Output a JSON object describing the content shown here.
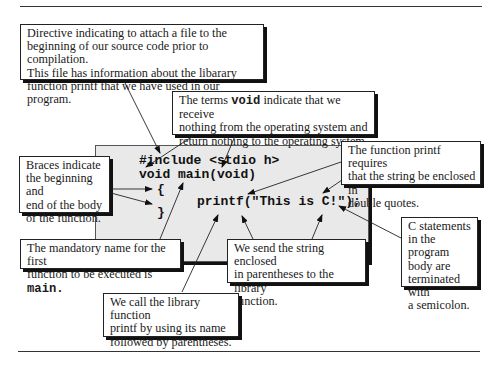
{
  "code": {
    "line1": "#include <stdio h>",
    "line2": "void main(void)",
    "brace_open": "{",
    "statement": "printf(\"This is C!\");",
    "brace_close": "}"
  },
  "callouts": {
    "include": {
      "lines": [
        "Directive indicating to attach a file to the",
        "beginning of our source code prior to compilation.",
        "This file has information about the libarary",
        "function printf that we have used in our program."
      ]
    },
    "void": {
      "pre": "The terms ",
      "keyword": "void",
      "post": " indicate that we receive",
      "line2": "nothing from the operating system and",
      "line3": "return nothing to the operating system."
    },
    "braces": {
      "lines": [
        "Braces indicate",
        "the beginning and",
        "end of the body",
        "of the function."
      ]
    },
    "quotes": {
      "lines": [
        "The function printf requires",
        "that the string be enclosed in",
        "double quotes."
      ]
    },
    "main_name": {
      "line1": "The mandatory name for the first",
      "line2_pre": "function to be executed is ",
      "keyword": "main."
    },
    "send_string": {
      "lines": [
        "We send the string enclosed",
        "in parentheses to the library",
        "function."
      ]
    },
    "semicolon": {
      "lines": [
        "C statements",
        "in the program",
        "body are",
        "terminated with",
        "a semicolon."
      ]
    },
    "call_function": {
      "lines": [
        "We call the library function",
        "printf by using its name",
        "followed by parentheses."
      ]
    }
  }
}
